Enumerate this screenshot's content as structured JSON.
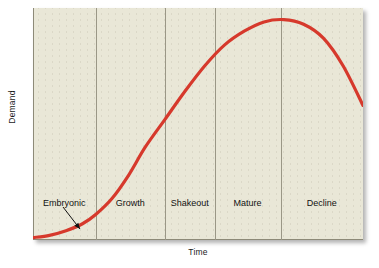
{
  "figure": {
    "background_color": "#ffffff",
    "panel_color": "#e9e7d7",
    "curve_color": "#d6392c",
    "divider_color": "#9a9786",
    "border_color": "#8d8a78",
    "text_color": "#111111"
  },
  "axes": {
    "y_title": "Demand",
    "x_title": "Time"
  },
  "annotation": {
    "leader_label": "Embryonic",
    "leader_from": [
      30,
      199
    ],
    "leader_to": [
      47,
      221
    ]
  },
  "chart_data": {
    "type": "line",
    "xlabel": "Time",
    "ylabel": "Demand",
    "xlim": [
      0,
      100
    ],
    "ylim": [
      0,
      100
    ],
    "grid": false,
    "legend": "none",
    "series": [
      {
        "name": "Demand",
        "x": [
          0,
          5,
          10,
          15,
          19,
          24,
          29,
          34,
          40,
          46,
          52,
          58,
          64,
          70,
          76,
          82,
          88,
          94,
          100
        ],
        "y": [
          1,
          2,
          4,
          7,
          11,
          18,
          28,
          40,
          52,
          64,
          75,
          84,
          90,
          94,
          95,
          93,
          87,
          75,
          58
        ]
      }
    ],
    "stage_boundaries": [
      0,
      19,
      40,
      55,
      75,
      100
    ],
    "stages": [
      {
        "label": "Embryonic",
        "x_start": 0,
        "x_end": 19,
        "center": 9.5
      },
      {
        "label": "Growth",
        "x_start": 19,
        "x_end": 40,
        "center": 29.5
      },
      {
        "label": "Shakeout",
        "x_start": 40,
        "x_end": 55,
        "center": 47.5
      },
      {
        "label": "Mature",
        "x_start": 55,
        "x_end": 75,
        "center": 65.0
      },
      {
        "label": "Decline",
        "x_start": 75,
        "x_end": 100,
        "center": 87.5
      }
    ]
  }
}
